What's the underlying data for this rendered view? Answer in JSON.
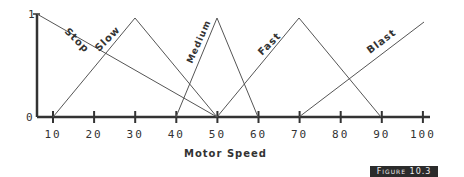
{
  "chart_data": {
    "type": "line",
    "title": "",
    "xlabel": "Motor Speed",
    "ylabel": "",
    "xlim": [
      10,
      100
    ],
    "ylim": [
      0,
      1
    ],
    "x_ticks": [
      10,
      20,
      30,
      40,
      50,
      60,
      70,
      80,
      90,
      100
    ],
    "y_ticks": [
      0,
      1
    ],
    "grid": false,
    "legend": "inline labels",
    "series": [
      {
        "name": "Stop",
        "points": [
          [
            10,
            1
          ],
          [
            50,
            0
          ]
        ]
      },
      {
        "name": "Slow",
        "points": [
          [
            10,
            0
          ],
          [
            30,
            1
          ],
          [
            50,
            0
          ]
        ]
      },
      {
        "name": "Medium",
        "points": [
          [
            40,
            0
          ],
          [
            50,
            1
          ],
          [
            60,
            0
          ]
        ]
      },
      {
        "name": "Fast",
        "points": [
          [
            50,
            0
          ],
          [
            70,
            1
          ],
          [
            90,
            0
          ]
        ]
      },
      {
        "name": "Blast",
        "points": [
          [
            70,
            0
          ],
          [
            100,
            1
          ]
        ]
      }
    ]
  },
  "figure_label": "Figure 10.3",
  "axis": {
    "xlabel": "Motor Speed",
    "y_top": "1",
    "y_bottom": "0"
  },
  "labels": {
    "stop": "Stop",
    "slow": "Slow",
    "medium": "Medium",
    "fast": "Fast",
    "blast": "Blast"
  },
  "ticks": [
    "10",
    "20",
    "30",
    "40",
    "50",
    "60",
    "70",
    "80",
    "90",
    "100"
  ]
}
